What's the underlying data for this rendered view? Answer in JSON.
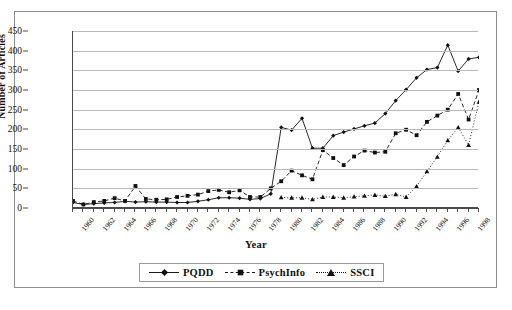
{
  "chart_data": {
    "type": "line",
    "title": "",
    "xlabel": "Year",
    "ylabel": "Number of Articles",
    "ylim": [
      0,
      450
    ],
    "ytick_step": 50,
    "yticks": [
      0,
      50,
      100,
      150,
      200,
      250,
      300,
      350,
      400,
      450
    ],
    "grid": true,
    "legend_position": "bottom-center",
    "xlim": [
      1960,
      1999
    ],
    "x": [
      1960,
      1961,
      1962,
      1963,
      1964,
      1965,
      1966,
      1967,
      1968,
      1969,
      1970,
      1971,
      1972,
      1973,
      1974,
      1975,
      1976,
      1977,
      1978,
      1979,
      1980,
      1981,
      1982,
      1983,
      1984,
      1985,
      1986,
      1987,
      1988,
      1989,
      1990,
      1991,
      1992,
      1993,
      1994,
      1995,
      1996,
      1997,
      1998,
      1999
    ],
    "xtick_labels": [
      "1960",
      "1962",
      "1964",
      "1966",
      "1968",
      "1970",
      "1972",
      "1974",
      "1976",
      "1978",
      "1980",
      "1982",
      "1984",
      "1986",
      "1988",
      "1990",
      "1992",
      "1994",
      "1996",
      "1998"
    ],
    "series": [
      {
        "name": "PQDD",
        "marker": "diamond",
        "linestyle": "solid",
        "color": "#111111",
        "values": [
          14,
          9,
          11,
          13,
          14,
          17,
          15,
          16,
          15,
          15,
          14,
          14,
          17,
          21,
          26,
          26,
          25,
          22,
          24,
          36,
          205,
          198,
          228,
          152,
          152,
          184,
          193,
          201,
          209,
          216,
          240,
          273,
          301,
          331,
          352,
          357,
          414,
          348,
          379,
          383
        ]
      },
      {
        "name": "PsychInfo",
        "marker": "square",
        "linestyle": "dashed",
        "color": "#111111",
        "values": [
          18,
          9,
          15,
          18,
          25,
          18,
          56,
          23,
          21,
          22,
          28,
          31,
          34,
          43,
          46,
          40,
          45,
          28,
          28,
          50,
          68,
          95,
          83,
          73,
          147,
          127,
          109,
          131,
          146,
          141,
          143,
          190,
          199,
          185,
          219,
          235,
          250,
          290,
          225,
          300
        ]
      },
      {
        "name": "SSCI",
        "marker": "triangle",
        "linestyle": "dotted",
        "color": "#111111",
        "values": [
          null,
          null,
          null,
          null,
          null,
          null,
          null,
          null,
          null,
          null,
          null,
          null,
          null,
          null,
          null,
          null,
          null,
          null,
          null,
          null,
          27,
          26,
          26,
          22,
          28,
          28,
          26,
          29,
          31,
          33,
          30,
          35,
          28,
          55,
          93,
          130,
          172,
          205,
          160,
          270
        ]
      }
    ]
  },
  "axis": {
    "y_title": "Number of Articles",
    "x_title": "Year"
  },
  "legend": {
    "items": [
      {
        "label": "PQDD",
        "marker": "diamond-marker",
        "linestyle": "solid"
      },
      {
        "label": "PsychInfo",
        "marker": "square-marker",
        "linestyle": "dashed"
      },
      {
        "label": "SSCI",
        "marker": "triangle-marker",
        "linestyle": "dotted"
      }
    ]
  }
}
